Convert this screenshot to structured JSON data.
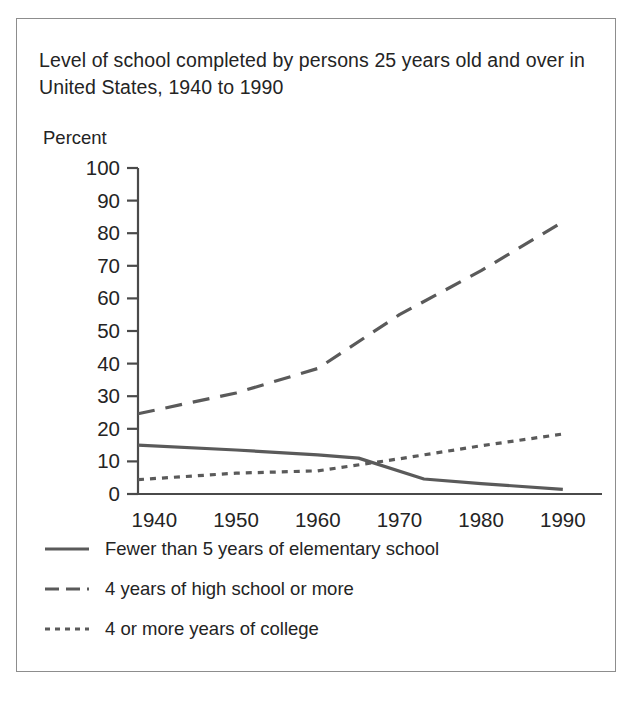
{
  "figure": {
    "title": "Level of school completed by persons 25 years old and over in United States, 1940 to 1990",
    "percent_label": "Percent"
  },
  "legend": {
    "items": [
      {
        "label": "Fewer than 5 years of elementary school",
        "style": "solid",
        "key_icon": "solid-line-icon"
      },
      {
        "label": "4 years of high school or more",
        "style": "dashed",
        "key_icon": "dashed-line-icon"
      },
      {
        "label": "4 or more years of college",
        "style": "dotted",
        "key_icon": "dotted-line-icon"
      }
    ]
  },
  "colors": {
    "line": "#5a5a5a",
    "axis": "#4a4a4a",
    "border": "#8d8d8d",
    "text": "#242424"
  },
  "chart_data": {
    "type": "line",
    "title": "Level of school completed by persons 25 years old and over in United States, 1940 to 1990",
    "xlabel": "",
    "ylabel": "Percent",
    "xlim": [
      1938,
      1991
    ],
    "ylim": [
      0,
      100
    ],
    "xticks": [
      1940,
      1950,
      1960,
      1970,
      1980,
      1990
    ],
    "yticks": [
      0,
      10,
      20,
      30,
      40,
      50,
      60,
      70,
      80,
      90,
      100
    ],
    "grid": false,
    "legend_position": "below",
    "series": [
      {
        "name": "Fewer than 5 years of elementary school",
        "style": "solid",
        "x": [
          1938,
          1950,
          1960,
          1965,
          1973,
          1980,
          1990
        ],
        "values": [
          15.0,
          13.5,
          12.0,
          11.0,
          4.6,
          3.2,
          1.4
        ]
      },
      {
        "name": "4 years of high school or more",
        "style": "dashed",
        "x": [
          1938,
          1950,
          1960,
          1970,
          1980,
          1990
        ],
        "values": [
          24.6,
          31.0,
          38.5,
          55.0,
          68.5,
          83.5
        ]
      },
      {
        "name": "4 or more years of college",
        "style": "dotted",
        "x": [
          1938,
          1950,
          1960,
          1970,
          1980,
          1990
        ],
        "values": [
          4.4,
          6.4,
          7.1,
          10.8,
          14.8,
          18.4
        ]
      }
    ]
  }
}
